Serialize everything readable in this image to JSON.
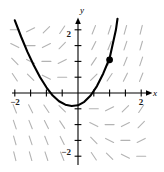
{
  "figure": {
    "title": "",
    "axis_labels": {
      "x": "x",
      "y": "y"
    },
    "tick_labels": {
      "x_neg2": "−2",
      "x_pos2": "2",
      "y_pos2": "2",
      "y_neg2": "−2"
    },
    "colors": {
      "curve": "#000000",
      "axis": "#000000",
      "slope_marks": "#b3b3b3",
      "point": "#000000",
      "background": "#ffffff"
    }
  },
  "chart_data": {
    "type": "line",
    "title": "",
    "subtitle": "",
    "xlabel": "x",
    "ylabel": "y",
    "xlim": [
      -2.35,
      2.35
    ],
    "ylim": [
      -2.55,
      2.45
    ],
    "grid": false,
    "legend": null,
    "xticks": [
      -2,
      -1.5,
      -1,
      -0.5,
      0.5,
      1,
      1.5,
      2
    ],
    "yticks": [
      -2,
      -1.5,
      -1,
      -0.5,
      0.5,
      1,
      1.5,
      2
    ],
    "xtick_labels": {
      "-2": "−2",
      "2": "2"
    },
    "ytick_labels": {
      "-2": "−2",
      "2": "2"
    },
    "series": [
      {
        "name": "solution-curve",
        "type": "line",
        "color": "#000000",
        "width": 2.1,
        "x": [
          -2.0,
          -1.8,
          -1.6,
          -1.4,
          -1.2,
          -1.0,
          -0.8,
          -0.6,
          -0.4,
          -0.2,
          0.0,
          0.2,
          0.4,
          0.6,
          0.8,
          1.0,
          1.2,
          1.25
        ],
        "y": [
          2.3,
          1.78,
          1.3,
          0.88,
          0.5,
          0.18,
          -0.08,
          -0.26,
          -0.37,
          -0.41,
          -0.39,
          -0.28,
          -0.08,
          0.22,
          0.62,
          1.1,
          2.0,
          2.35
        ]
      }
    ],
    "points": [
      {
        "name": "initial-condition-point",
        "x": 1.0,
        "y": 1.05,
        "marker": "circle",
        "size": 3.4,
        "color": "#000000"
      }
    ],
    "slope_field": {
      "name": "direction-field",
      "color": "#b3b3b3",
      "segment_length": 9,
      "x_samples": [
        -2.0,
        -1.5,
        -1.0,
        -0.5,
        0.5,
        1.0,
        1.5,
        2.0
      ],
      "y_samples": [
        2.0,
        1.5,
        1.0,
        0.5,
        -0.5,
        -1.0,
        -1.5,
        -2.0
      ],
      "slope_rule": "dy/dx = x + y (approximately); marks slope at each lattice point"
    }
  }
}
